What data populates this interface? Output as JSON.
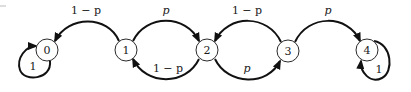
{
  "diagram": {
    "type": "markov-chain-state-transition",
    "colors": {
      "stroke": "#111111",
      "node_fill": "#ffffff",
      "text": "#1a1a1a"
    },
    "nodes": [
      {
        "id": "0",
        "label": "0",
        "cx": 47,
        "cy": 50
      },
      {
        "id": "1",
        "label": "1",
        "cx": 126,
        "cy": 50
      },
      {
        "id": "2",
        "label": "2",
        "cx": 207,
        "cy": 50
      },
      {
        "id": "3",
        "label": "3",
        "cx": 288,
        "cy": 51
      },
      {
        "id": "4",
        "label": "4",
        "cx": 367,
        "cy": 50
      }
    ],
    "edges": [
      {
        "from": "1",
        "to": "0",
        "label": "1 − p",
        "position": "top"
      },
      {
        "from": "1",
        "to": "2",
        "label": "p",
        "position": "top"
      },
      {
        "from": "2",
        "to": "1",
        "label": "1 − p",
        "position": "bottom"
      },
      {
        "from": "3",
        "to": "2",
        "label": "1 − p",
        "position": "top"
      },
      {
        "from": "2",
        "to": "3",
        "label": "p",
        "position": "bottom"
      },
      {
        "from": "3",
        "to": "4",
        "label": "p",
        "position": "top"
      },
      {
        "from": "0",
        "to": "0",
        "label": "1",
        "position": "self-loop"
      },
      {
        "from": "4",
        "to": "4",
        "label": "1",
        "position": "self-loop"
      }
    ]
  }
}
